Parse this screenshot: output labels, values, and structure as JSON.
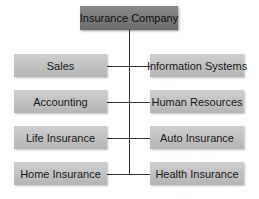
{
  "root": {
    "label": "Insurance Company"
  },
  "left": [
    {
      "label": "Sales"
    },
    {
      "label": "Accounting"
    },
    {
      "label": "Life Insurance"
    },
    {
      "label": "Home Insurance"
    }
  ],
  "right": [
    {
      "label": "Information Systems"
    },
    {
      "label": "Human Resources"
    },
    {
      "label": "Auto Insurance"
    },
    {
      "label": "Health Insurance"
    }
  ]
}
